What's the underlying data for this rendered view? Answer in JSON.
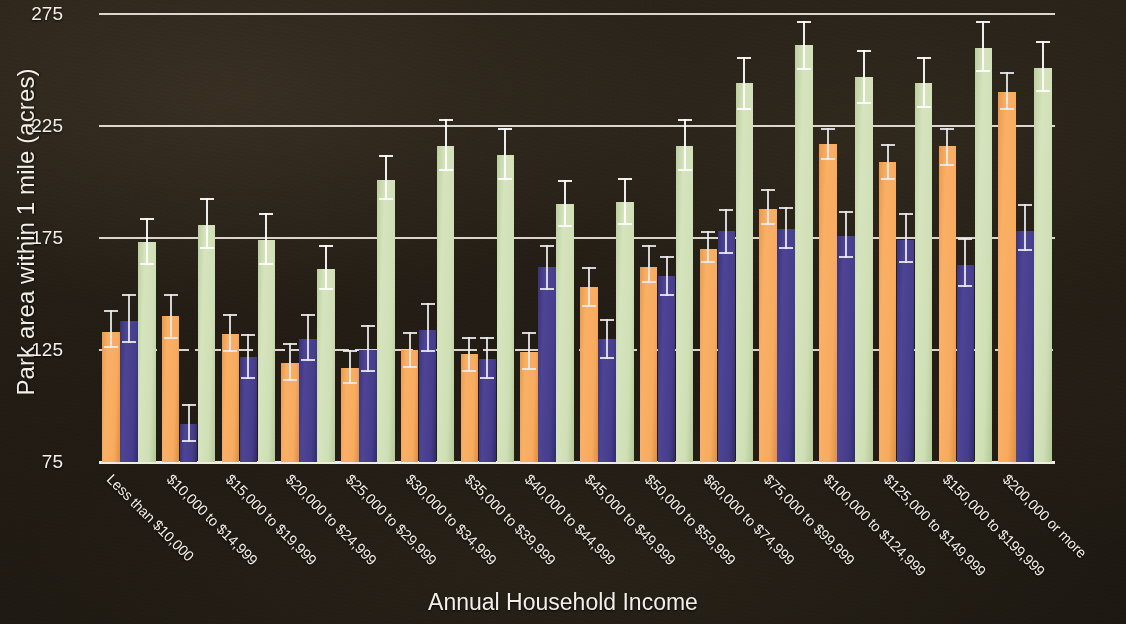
{
  "chart_data": {
    "type": "bar",
    "title": "",
    "xlabel": "Annual Household Income",
    "ylabel": "Park area within 1 mile (acres)",
    "ylim": [
      75,
      275
    ],
    "yticks": [
      75,
      125,
      175,
      225,
      275
    ],
    "grid": true,
    "legend_position": "none",
    "categories": [
      "Less than $10,000",
      "$10,000 to $14,999",
      "$15,000 to $19,999",
      "$20,000 to $24,999",
      "$25,000 to $29,999",
      "$30,000 to $34,999",
      "$35,000 to $39,999",
      "$40,000 to $44,999",
      "$45,000 to $49,999",
      "$50,000 to $59,999",
      "$60,000 to $74,999",
      "$75,000 to $99,999",
      "$100,000 to $124,999",
      "$125,000 to $149,999",
      "$150,000 to $199,999",
      "$200,000 or more"
    ],
    "series": [
      {
        "name": "series-1",
        "color": "#f7ab5f",
        "values": [
          133,
          140,
          132,
          119,
          117,
          125,
          123,
          124,
          153,
          162,
          170,
          188,
          217,
          209,
          216,
          240
        ],
        "err_low": [
          126,
          130,
          124,
          111,
          110,
          117,
          115,
          116,
          144,
          155,
          164,
          181,
          210,
          201,
          207,
          232
        ],
        "err_high": [
          143,
          150,
          141,
          128,
          125,
          133,
          131,
          133,
          162,
          172,
          178,
          197,
          224,
          217,
          224,
          249
        ]
      },
      {
        "name": "series-2",
        "color": "#463e8c",
        "values": [
          138,
          92,
          122,
          130,
          125,
          134,
          121,
          162,
          130,
          158,
          178,
          179,
          176,
          174,
          163,
          178
        ],
        "err_low": [
          128,
          84,
          112,
          120,
          115,
          124,
          112,
          152,
          121,
          149,
          168,
          170,
          166,
          164,
          153,
          169
        ],
        "err_high": [
          150,
          101,
          132,
          141,
          136,
          146,
          131,
          172,
          139,
          167,
          188,
          189,
          187,
          186,
          175,
          190
        ]
      },
      {
        "name": "series-3",
        "color": "#cfdfb5",
        "values": [
          173,
          181,
          174,
          161,
          201,
          216,
          212,
          190,
          191,
          216,
          244,
          261,
          247,
          244,
          260,
          251
        ],
        "err_low": [
          163,
          170,
          163,
          152,
          192,
          205,
          201,
          180,
          181,
          205,
          232,
          250,
          235,
          233,
          249,
          240
        ],
        "err_high": [
          184,
          193,
          186,
          172,
          212,
          228,
          224,
          201,
          202,
          228,
          256,
          272,
          259,
          256,
          272,
          263
        ]
      }
    ]
  },
  "axes": {
    "ytick_labels": [
      "275",
      "225",
      "175",
      "125",
      "75"
    ]
  },
  "theme": {
    "background": "#241f18",
    "text": "#f4f1ea",
    "gridline": "#e9e6dd",
    "series_colors": [
      "#f7ab5f",
      "#463e8c",
      "#cfdfb5"
    ]
  }
}
